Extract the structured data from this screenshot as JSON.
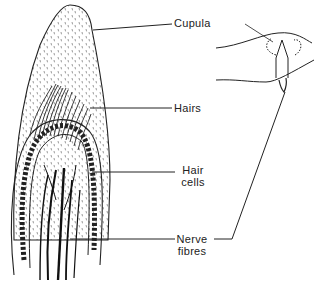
{
  "diagram": {
    "labels": {
      "cupula": "Cupula",
      "hairs": "Hairs",
      "hair_cells_line1": "Hair",
      "hair_cells_line2": "cells",
      "nerve_fibres_line1": "Nerve",
      "nerve_fibres_line2": "fibres"
    },
    "colors": {
      "ink": "#222222",
      "background": "#ffffff"
    }
  }
}
